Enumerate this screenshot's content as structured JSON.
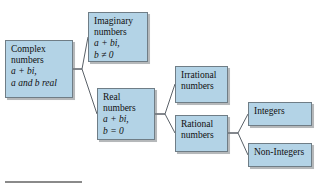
{
  "diagram": {
    "type": "tree",
    "colors": {
      "node_fill": "#b3d3e6",
      "node_border": "#6f7d86",
      "connector": "#5a6168",
      "text": "#101010",
      "rule": "#8a8a8a"
    },
    "nodes": [
      {
        "id": "complex",
        "lines": [
          "Complex",
          "numbers",
          "a + bi,",
          "a and b real"
        ]
      },
      {
        "id": "imaginary",
        "lines": [
          "Imaginary",
          "numbers",
          "a + bi,",
          "b ≠ 0"
        ]
      },
      {
        "id": "real",
        "lines": [
          "Real",
          "numbers",
          "a + bi,",
          "b = 0"
        ]
      },
      {
        "id": "irrational",
        "lines": [
          "Irrational",
          "numbers"
        ]
      },
      {
        "id": "rational",
        "lines": [
          "Rational",
          "numbers"
        ]
      },
      {
        "id": "integers",
        "lines": [
          "Integers"
        ]
      },
      {
        "id": "nonintegers",
        "lines": [
          "Non-Integers"
        ]
      }
    ],
    "edges": [
      {
        "from": "complex",
        "to": "imaginary"
      },
      {
        "from": "complex",
        "to": "real"
      },
      {
        "from": "real",
        "to": "irrational"
      },
      {
        "from": "real",
        "to": "rational"
      },
      {
        "from": "rational",
        "to": "integers"
      },
      {
        "from": "rational",
        "to": "nonintegers"
      }
    ]
  }
}
